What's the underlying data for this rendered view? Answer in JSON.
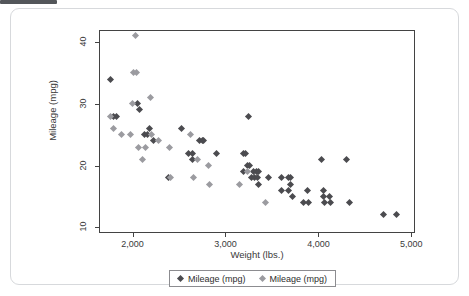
{
  "card": {
    "background_color": "#ffffff",
    "border_color": "#d7d9dc"
  },
  "artifact": {
    "name": "clipped-toolbar-edge",
    "color": "#53565a"
  },
  "chart_data": {
    "type": "scatter",
    "title": "",
    "xlabel": "Weight (lbs.)",
    "ylabel": "Mileage (mpg)",
    "xlim": [
      1650,
      5050
    ],
    "ylim": [
      8.9,
      41.8
    ],
    "xticks": [
      2000,
      3000,
      4000,
      5000
    ],
    "xtick_labels": [
      "2,000",
      "3,000",
      "4,000",
      "5,000"
    ],
    "yticks": [
      10,
      20,
      30,
      40
    ],
    "ytick_labels": [
      "10",
      "20",
      "30",
      "40"
    ],
    "grid": false,
    "legend_position": "bottom",
    "series": [
      {
        "name": "Mileage (mpg)",
        "color": "#4b4b4f",
        "marker": "diamond",
        "points": [
          [
            1760,
            34
          ],
          [
            1800,
            28
          ],
          [
            1830,
            28
          ],
          [
            2050,
            30
          ],
          [
            2070,
            29
          ],
          [
            2130,
            25
          ],
          [
            2160,
            25
          ],
          [
            2180,
            26
          ],
          [
            2230,
            24
          ],
          [
            2390,
            18
          ],
          [
            2530,
            26
          ],
          [
            2600,
            22
          ],
          [
            2640,
            22
          ],
          [
            2640,
            21
          ],
          [
            2720,
            24
          ],
          [
            2750,
            24
          ],
          [
            2760,
            24
          ],
          [
            2900,
            22
          ],
          [
            3190,
            22
          ],
          [
            3220,
            22
          ],
          [
            3250,
            28
          ],
          [
            3190,
            19
          ],
          [
            3240,
            20
          ],
          [
            3260,
            20
          ],
          [
            3300,
            19
          ],
          [
            3330,
            19
          ],
          [
            3360,
            19
          ],
          [
            3280,
            18
          ],
          [
            3310,
            18
          ],
          [
            3340,
            18
          ],
          [
            3350,
            17
          ],
          [
            3460,
            18
          ],
          [
            3600,
            18
          ],
          [
            3680,
            18
          ],
          [
            3700,
            18
          ],
          [
            3600,
            16
          ],
          [
            3680,
            16
          ],
          [
            3700,
            17
          ],
          [
            3720,
            15
          ],
          [
            3840,
            14
          ],
          [
            3890,
            14
          ],
          [
            3880,
            16
          ],
          [
            4030,
            21
          ],
          [
            4050,
            16
          ],
          [
            4060,
            15
          ],
          [
            4070,
            14
          ],
          [
            4120,
            15
          ],
          [
            4130,
            14
          ],
          [
            4300,
            21
          ],
          [
            4330,
            14
          ],
          [
            4700,
            12
          ],
          [
            4840,
            12
          ]
        ]
      },
      {
        "name": "Mileage (mpg)",
        "color": "#9b9ba0",
        "marker": "diamond",
        "points": [
          [
            1760,
            28
          ],
          [
            1800,
            26
          ],
          [
            1880,
            25
          ],
          [
            1980,
            25
          ],
          [
            2000,
            30
          ],
          [
            2030,
            41
          ],
          [
            2010,
            35
          ],
          [
            2040,
            35
          ],
          [
            2060,
            23
          ],
          [
            2110,
            21
          ],
          [
            2140,
            23
          ],
          [
            2190,
            31
          ],
          [
            2200,
            25
          ],
          [
            2280,
            24
          ],
          [
            2400,
            23
          ],
          [
            2410,
            18
          ],
          [
            2620,
            25
          ],
          [
            2660,
            18
          ],
          [
            2700,
            21
          ],
          [
            2820,
            20
          ],
          [
            2830,
            17
          ],
          [
            3150,
            17
          ],
          [
            3240,
            19
          ],
          [
            3430,
            14
          ]
        ]
      }
    ]
  },
  "legend": {
    "entries": [
      {
        "label": "Mileage (mpg)",
        "color": "#4b4b4f"
      },
      {
        "label": "Mileage (mpg)",
        "color": "#9b9ba0"
      }
    ]
  }
}
